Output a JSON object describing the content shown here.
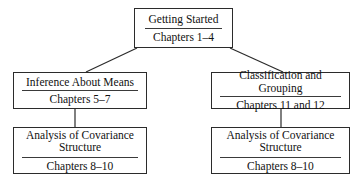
{
  "diagram": {
    "type": "hierarchy-tree",
    "orientation": "top-down",
    "line_color": "#2b2b2b",
    "background_color": "#ffffff",
    "nodes": [
      {
        "id": "getting-started",
        "title": "Getting Started",
        "chapters": "Chapters 1–4",
        "level": 0
      },
      {
        "id": "inference",
        "title": "Inference About Means",
        "chapters": "Chapters 5–7",
        "level": 1
      },
      {
        "id": "classification",
        "title": "Classification and Grouping",
        "chapters": "Chapters 11 and 12",
        "level": 1
      },
      {
        "id": "covariance-left",
        "title": "Analysis of Covariance\nStructure",
        "chapters": "Chapters 8–10",
        "level": 2
      },
      {
        "id": "covariance-right",
        "title": "Analysis of Covariance\nStructure",
        "chapters": "Chapters 8–10",
        "level": 2
      }
    ],
    "edges": [
      {
        "from": "getting-started",
        "to": "inference",
        "style": "diagonal"
      },
      {
        "from": "getting-started",
        "to": "classification",
        "style": "diagonal"
      },
      {
        "from": "inference",
        "to": "covariance-left",
        "style": "vertical"
      },
      {
        "from": "classification",
        "to": "covariance-right",
        "style": "vertical"
      }
    ]
  }
}
